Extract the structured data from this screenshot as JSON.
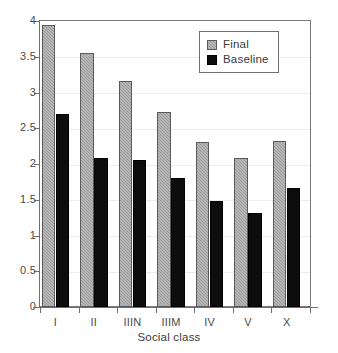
{
  "chart_data": {
    "type": "bar",
    "title": "",
    "subtitle": "",
    "xlabel": "Social class",
    "ylabel": "",
    "categories": [
      "I",
      "II",
      "IIIN",
      "IIIM",
      "IV",
      "V",
      "X"
    ],
    "series": [
      {
        "name": "Final",
        "color": "#9a9a9a",
        "values": [
          3.95,
          3.55,
          3.16,
          2.73,
          2.31,
          2.08,
          2.32
        ]
      },
      {
        "name": "Baseline",
        "color": "#0d0d0d",
        "values": [
          2.7,
          2.09,
          2.06,
          1.81,
          1.48,
          1.32,
          1.67
        ]
      }
    ],
    "ylim": [
      0,
      4
    ],
    "ytick_values": [
      0,
      0.5,
      1,
      1.5,
      2,
      2.5,
      3,
      3.5,
      4
    ],
    "ytick_labels": [
      "0",
      "0.5",
      "1",
      "1.5",
      "2",
      "2.5",
      "3",
      "3.5",
      "4"
    ],
    "grid": true,
    "grid_axis": "y",
    "legend_position": "top-right",
    "frame": true,
    "bar_group_mode": "grouped"
  },
  "legend": {
    "entries": [
      {
        "label": "Final",
        "swatch": "gray-checkered-swatch"
      },
      {
        "label": "Baseline",
        "swatch": "black-solid-swatch"
      }
    ]
  },
  "axes": {
    "x_title": "Social class",
    "y_title": ""
  }
}
